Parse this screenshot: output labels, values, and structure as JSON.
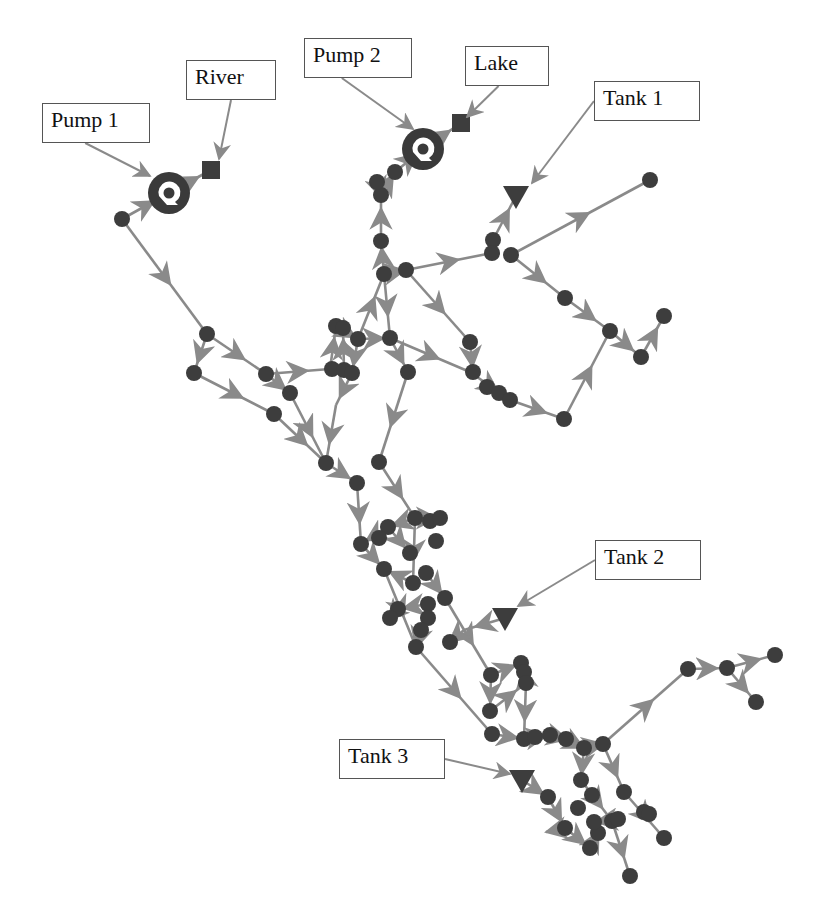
{
  "diagram": {
    "type": "water-distribution-network",
    "colors": {
      "pipe": "#8a8a8a",
      "node": "#3d3d3d",
      "pump_ring": "#3a3a3a",
      "label_border": "#555555",
      "background": "#ffffff"
    },
    "labels": [
      {
        "id": "pump1",
        "text": "Pump 1",
        "box": [
          42,
          103,
          108,
          40
        ],
        "target": [
          150,
          176
        ]
      },
      {
        "id": "river",
        "text": "River",
        "box": [
          186,
          60,
          90,
          40
        ],
        "target": [
          219,
          159
        ]
      },
      {
        "id": "pump2",
        "text": "Pump 2",
        "box": [
          304,
          38,
          108,
          40
        ],
        "target": [
          413,
          129
        ]
      },
      {
        "id": "lake",
        "text": "Lake",
        "box": [
          465,
          46,
          84,
          40
        ],
        "target": [
          467,
          117
        ]
      },
      {
        "id": "tank1",
        "text": "Tank 1",
        "box": [
          594,
          81,
          106,
          40
        ],
        "target": [
          532,
          183
        ]
      },
      {
        "id": "tank2",
        "text": "Tank 2",
        "box": [
          595,
          540,
          106,
          40
        ],
        "target": [
          518,
          606
        ]
      },
      {
        "id": "tank3",
        "text": "Tank 3",
        "box": [
          339,
          739,
          106,
          40
        ],
        "target": [
          510,
          774
        ]
      }
    ],
    "reservoirs": [
      {
        "name": "River",
        "x": 211,
        "y": 170
      },
      {
        "name": "Lake",
        "x": 461,
        "y": 123
      }
    ],
    "pumps": [
      {
        "name": "Pump 1",
        "x": 169,
        "y": 193
      },
      {
        "name": "Pump 2",
        "x": 423,
        "y": 149
      }
    ],
    "tanks": [
      {
        "name": "Tank 1",
        "x": 516,
        "y": 196
      },
      {
        "name": "Tank 2",
        "x": 505,
        "y": 618
      },
      {
        "name": "Tank 3",
        "x": 522,
        "y": 780
      }
    ],
    "junctions": [
      [
        122,
        219
      ],
      [
        207,
        334
      ],
      [
        194,
        373
      ],
      [
        266,
        374
      ],
      [
        290,
        393
      ],
      [
        274,
        414
      ],
      [
        336,
        326
      ],
      [
        343,
        328
      ],
      [
        332,
        369
      ],
      [
        344,
        370
      ],
      [
        352,
        373
      ],
      [
        358,
        339
      ],
      [
        390,
        338
      ],
      [
        384,
        274
      ],
      [
        406,
        270
      ],
      [
        381,
        241
      ],
      [
        381,
        195
      ],
      [
        395,
        172
      ],
      [
        377,
        182
      ],
      [
        470,
        342
      ],
      [
        473,
        372
      ],
      [
        487,
        387
      ],
      [
        499,
        393
      ],
      [
        510,
        400
      ],
      [
        564,
        419
      ],
      [
        610,
        331
      ],
      [
        664,
        316
      ],
      [
        641,
        357
      ],
      [
        650,
        180
      ],
      [
        493,
        240
      ],
      [
        492,
        253
      ],
      [
        511,
        255
      ],
      [
        565,
        298
      ],
      [
        408,
        372
      ],
      [
        379,
        462
      ],
      [
        326,
        463
      ],
      [
        357,
        483
      ],
      [
        415,
        518
      ],
      [
        430,
        521
      ],
      [
        440,
        518
      ],
      [
        388,
        527
      ],
      [
        379,
        538
      ],
      [
        410,
        553
      ],
      [
        361,
        544
      ],
      [
        384,
        569
      ],
      [
        413,
        583
      ],
      [
        426,
        573
      ],
      [
        445,
        598
      ],
      [
        398,
        609
      ],
      [
        390,
        618
      ],
      [
        428,
        604
      ],
      [
        428,
        618
      ],
      [
        421,
        630
      ],
      [
        416,
        647
      ],
      [
        450,
        642
      ],
      [
        436,
        541
      ],
      [
        491,
        675
      ],
      [
        521,
        663
      ],
      [
        524,
        672
      ],
      [
        526,
        683
      ],
      [
        490,
        711
      ],
      [
        492,
        734
      ],
      [
        524,
        739
      ],
      [
        535,
        737
      ],
      [
        550,
        735
      ],
      [
        566,
        739
      ],
      [
        603,
        744
      ],
      [
        688,
        669
      ],
      [
        727,
        668
      ],
      [
        775,
        655
      ],
      [
        756,
        702
      ],
      [
        584,
        748
      ],
      [
        581,
        780
      ],
      [
        592,
        795
      ],
      [
        624,
        792
      ],
      [
        548,
        797
      ],
      [
        565,
        828
      ],
      [
        598,
        833
      ],
      [
        594,
        822
      ],
      [
        612,
        821
      ],
      [
        618,
        819
      ],
      [
        590,
        848
      ],
      [
        630,
        876
      ],
      [
        578,
        808
      ],
      [
        644,
        812
      ],
      [
        649,
        814
      ],
      [
        664,
        838
      ]
    ],
    "pipes": [
      [
        122,
        219,
        169,
        193
      ],
      [
        169,
        193,
        211,
        170
      ],
      [
        122,
        219,
        207,
        334
      ],
      [
        207,
        334,
        194,
        373
      ],
      [
        207,
        334,
        266,
        374
      ],
      [
        194,
        373,
        274,
        414
      ],
      [
        266,
        374,
        330,
        369
      ],
      [
        266,
        374,
        290,
        393
      ],
      [
        290,
        393,
        326,
        463
      ],
      [
        274,
        414,
        326,
        463
      ],
      [
        330,
        369,
        336,
        326
      ],
      [
        344,
        370,
        343,
        328
      ],
      [
        336,
        326,
        358,
        339
      ],
      [
        358,
        339,
        352,
        373
      ],
      [
        358,
        339,
        384,
        274
      ],
      [
        358,
        339,
        390,
        338
      ],
      [
        384,
        274,
        406,
        270
      ],
      [
        384,
        274,
        381,
        241
      ],
      [
        381,
        241,
        381,
        195
      ],
      [
        381,
        195,
        395,
        172
      ],
      [
        395,
        172,
        423,
        149
      ],
      [
        423,
        149,
        461,
        123
      ],
      [
        377,
        182,
        381,
        195
      ],
      [
        384,
        274,
        390,
        338
      ],
      [
        406,
        270,
        470,
        342
      ],
      [
        390,
        338,
        470,
        372
      ],
      [
        470,
        342,
        473,
        372
      ],
      [
        470,
        372,
        510,
        400
      ],
      [
        510,
        400,
        564,
        419
      ],
      [
        564,
        419,
        610,
        331
      ],
      [
        610,
        331,
        641,
        357
      ],
      [
        641,
        357,
        664,
        316
      ],
      [
        565,
        298,
        610,
        331
      ],
      [
        511,
        255,
        565,
        298
      ],
      [
        511,
        255,
        650,
        180
      ],
      [
        406,
        270,
        492,
        253
      ],
      [
        493,
        240,
        516,
        196
      ],
      [
        390,
        338,
        408,
        372
      ],
      [
        408,
        372,
        379,
        462
      ],
      [
        352,
        373,
        336,
        405
      ],
      [
        336,
        405,
        326,
        463
      ],
      [
        379,
        462,
        415,
        518
      ],
      [
        415,
        518,
        440,
        518
      ],
      [
        415,
        518,
        388,
        527
      ],
      [
        388,
        527,
        361,
        544
      ],
      [
        326,
        463,
        357,
        483
      ],
      [
        357,
        483,
        361,
        544
      ],
      [
        361,
        544,
        384,
        569
      ],
      [
        384,
        569,
        416,
        647
      ],
      [
        415,
        518,
        413,
        583
      ],
      [
        388,
        527,
        410,
        553
      ],
      [
        413,
        583,
        384,
        569
      ],
      [
        426,
        573,
        445,
        598
      ],
      [
        445,
        598,
        491,
        675
      ],
      [
        505,
        618,
        464,
        630
      ],
      [
        464,
        630,
        450,
        642
      ],
      [
        416,
        647,
        492,
        734
      ],
      [
        421,
        630,
        416,
        647
      ],
      [
        428,
        604,
        398,
        609
      ],
      [
        398,
        609,
        390,
        618
      ],
      [
        491,
        675,
        521,
        663
      ],
      [
        491,
        675,
        490,
        711
      ],
      [
        490,
        711,
        526,
        683
      ],
      [
        526,
        683,
        524,
        672
      ],
      [
        526,
        683,
        524,
        739
      ],
      [
        492,
        734,
        524,
        739
      ],
      [
        524,
        739,
        550,
        735
      ],
      [
        550,
        735,
        566,
        739
      ],
      [
        566,
        739,
        584,
        748
      ],
      [
        584,
        748,
        603,
        744
      ],
      [
        603,
        744,
        688,
        669
      ],
      [
        688,
        669,
        727,
        668
      ],
      [
        727,
        668,
        775,
        655
      ],
      [
        727,
        668,
        756,
        702
      ],
      [
        584,
        748,
        581,
        780
      ],
      [
        603,
        744,
        624,
        792
      ],
      [
        581,
        780,
        612,
        821
      ],
      [
        624,
        792,
        664,
        838
      ],
      [
        522,
        780,
        548,
        797
      ],
      [
        548,
        797,
        565,
        828
      ],
      [
        565,
        828,
        546,
        832
      ],
      [
        565,
        828,
        590,
        848
      ],
      [
        590,
        848,
        598,
        833
      ],
      [
        612,
        821,
        630,
        876
      ],
      [
        618,
        819,
        594,
        822
      ]
    ]
  }
}
